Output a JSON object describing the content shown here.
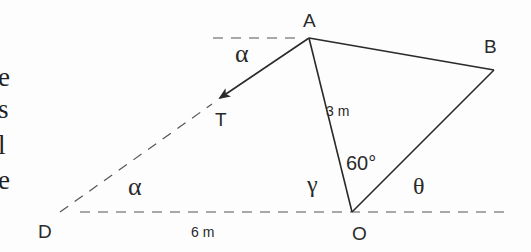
{
  "left_text_fragments": [
    "e",
    "s",
    "l",
    "e"
  ],
  "diagram": {
    "points": {
      "A": {
        "label": "A",
        "x": 309,
        "y": 38
      },
      "B": {
        "label": "B",
        "x": 494,
        "y": 70
      },
      "O": {
        "label": "O",
        "x": 352,
        "y": 212
      },
      "D": {
        "label": "D",
        "x": 60,
        "y": 212
      },
      "T": {
        "label": "T",
        "x": 219,
        "y": 99
      }
    },
    "labels": {
      "A": "A",
      "B": "B",
      "O": "O",
      "D": "D",
      "T": "T",
      "AO_length": "3 m",
      "DO_length": "6 m",
      "angle_AOB": "60°",
      "alpha_top": "α",
      "alpha_bottom": "α",
      "gamma": "γ",
      "theta": "θ"
    },
    "colors": {
      "stroke": "#2a2a2a",
      "dashed": "#555555"
    }
  }
}
